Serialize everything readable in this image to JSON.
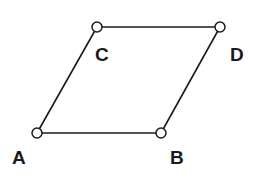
{
  "diagram": {
    "type": "parallelogram",
    "vertices": [
      {
        "id": "A",
        "label": "A",
        "x": 37,
        "y": 133,
        "label_x": 12,
        "label_y": 164
      },
      {
        "id": "B",
        "label": "B",
        "x": 161,
        "y": 133,
        "label_x": 170,
        "label_y": 164
      },
      {
        "id": "C",
        "label": "C",
        "x": 97,
        "y": 27,
        "label_x": 95,
        "label_y": 61
      },
      {
        "id": "D",
        "label": "D",
        "x": 220,
        "y": 27,
        "label_x": 230,
        "label_y": 61
      }
    ],
    "edges": [
      [
        "A",
        "B"
      ],
      [
        "B",
        "D"
      ],
      [
        "D",
        "C"
      ],
      [
        "C",
        "A"
      ]
    ],
    "colors": {
      "stroke": "#1a1a1a",
      "vertex_fill": "#ffffff",
      "background": "#ffffff"
    }
  }
}
